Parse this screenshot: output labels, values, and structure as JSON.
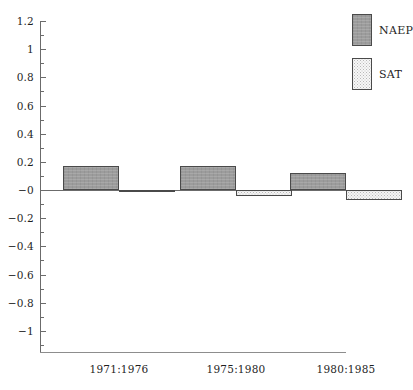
{
  "chart_data": {
    "type": "bar",
    "title": "",
    "subtitle": "",
    "xlabel": "",
    "ylabel": "",
    "categories": [
      "1971:1976",
      "1975:1980",
      "1980:1985"
    ],
    "series": [
      {
        "name": "NAEP",
        "values": [
          0.17,
          0.17,
          0.12
        ],
        "color": "#9c9c9c",
        "pattern": "solid-gray"
      },
      {
        "name": "SAT",
        "values": [
          -0.005,
          -0.04,
          -0.07
        ],
        "color": "#f4f4f4",
        "pattern": "stippled"
      }
    ],
    "ylim": [
      -1.2,
      1.2
    ],
    "y_major_ticks": [
      1.2,
      1,
      0.8,
      0.6,
      0.4,
      0.2,
      0,
      -0.2,
      -0.4,
      -0.6,
      -0.8,
      -1
    ],
    "y_tick_labels": [
      "1.2",
      "1",
      "0.8",
      "0.6",
      "0.4",
      "0.2",
      "−0",
      "−0.2",
      "−0.4",
      "−0.6",
      "−0.8",
      "−1"
    ],
    "y_minor_ticks": [
      1.1,
      0.9,
      0.7,
      0.5,
      0.3,
      0.1,
      -0.1,
      -0.3,
      -0.5,
      -0.7,
      -0.9,
      -1.1
    ],
    "grid": false,
    "legend_position": "top-right",
    "legend_entries": [
      "NAEP",
      "SAT"
    ]
  },
  "legend": {
    "items": [
      {
        "label": "NAEP"
      },
      {
        "label": "SAT"
      }
    ]
  }
}
